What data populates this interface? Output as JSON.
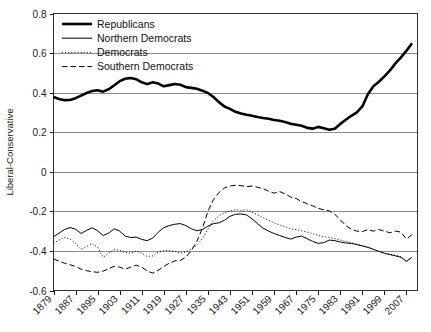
{
  "chart_data": {
    "type": "line",
    "title": "",
    "xlabel": "",
    "ylabel": "Liberal-Conservative",
    "xlim": [
      1879,
      2011
    ],
    "ylim": [
      -0.6,
      0.8
    ],
    "grid": true,
    "legend_position": "top-left",
    "y_ticks": [
      "0.8",
      "0.6",
      "0.4",
      "0.2",
      "0",
      "-0.2",
      "-0.4",
      "-0.6"
    ],
    "y_tick_values": [
      0.8,
      0.6,
      0.4,
      0.2,
      0,
      -0.2,
      -0.4,
      -0.6
    ],
    "x_ticks": [
      "1879",
      "1887",
      "1895",
      "1903",
      "1911",
      "1919",
      "1927",
      "1935",
      "1943",
      "1951",
      "1959",
      "1967",
      "1975",
      "1983",
      "1991",
      "1999",
      "2007"
    ],
    "x_tick_values": [
      1879,
      1887,
      1895,
      1903,
      1911,
      1919,
      1927,
      1935,
      1943,
      1951,
      1959,
      1967,
      1975,
      1983,
      1991,
      1999,
      2007
    ],
    "x": [
      1879,
      1881,
      1883,
      1885,
      1887,
      1889,
      1891,
      1893,
      1895,
      1897,
      1899,
      1901,
      1903,
      1905,
      1907,
      1909,
      1911,
      1913,
      1915,
      1917,
      1919,
      1921,
      1923,
      1925,
      1927,
      1929,
      1931,
      1933,
      1935,
      1937,
      1939,
      1941,
      1943,
      1945,
      1947,
      1949,
      1951,
      1953,
      1955,
      1957,
      1959,
      1961,
      1963,
      1965,
      1967,
      1969,
      1971,
      1973,
      1975,
      1977,
      1979,
      1981,
      1983,
      1985,
      1987,
      1989,
      1991,
      1993,
      1995,
      1997,
      1999,
      2001,
      2003,
      2005,
      2007,
      2009
    ],
    "series": [
      {
        "name": "Republicans",
        "style": "thick-solid",
        "values": [
          0.378,
          0.368,
          0.362,
          0.363,
          0.372,
          0.385,
          0.398,
          0.408,
          0.412,
          0.405,
          0.417,
          0.437,
          0.458,
          0.47,
          0.474,
          0.468,
          0.452,
          0.443,
          0.452,
          0.446,
          0.432,
          0.438,
          0.444,
          0.44,
          0.428,
          0.424,
          0.42,
          0.41,
          0.398,
          0.378,
          0.352,
          0.33,
          0.318,
          0.303,
          0.295,
          0.288,
          0.283,
          0.277,
          0.272,
          0.268,
          0.262,
          0.258,
          0.252,
          0.243,
          0.238,
          0.233,
          0.222,
          0.218,
          0.227,
          0.22,
          0.212,
          0.218,
          0.242,
          0.263,
          0.283,
          0.3,
          0.33,
          0.392,
          0.432,
          0.455,
          0.482,
          0.512,
          0.548,
          0.578,
          0.612,
          0.65
        ]
      },
      {
        "name": "Northern Democrats",
        "style": "thin-solid",
        "values": [
          -0.328,
          -0.31,
          -0.292,
          -0.282,
          -0.29,
          -0.312,
          -0.296,
          -0.283,
          -0.298,
          -0.322,
          -0.31,
          -0.288,
          -0.3,
          -0.325,
          -0.332,
          -0.33,
          -0.342,
          -0.348,
          -0.335,
          -0.305,
          -0.282,
          -0.272,
          -0.265,
          -0.262,
          -0.272,
          -0.288,
          -0.298,
          -0.292,
          -0.275,
          -0.262,
          -0.258,
          -0.245,
          -0.225,
          -0.215,
          -0.213,
          -0.218,
          -0.238,
          -0.262,
          -0.285,
          -0.3,
          -0.312,
          -0.322,
          -0.332,
          -0.34,
          -0.33,
          -0.325,
          -0.338,
          -0.352,
          -0.362,
          -0.358,
          -0.345,
          -0.348,
          -0.355,
          -0.36,
          -0.362,
          -0.368,
          -0.375,
          -0.382,
          -0.392,
          -0.402,
          -0.412,
          -0.418,
          -0.425,
          -0.432,
          -0.452,
          -0.432
        ]
      },
      {
        "name": "Democrats",
        "style": "dotted",
        "values": [
          -0.362,
          -0.345,
          -0.332,
          -0.34,
          -0.362,
          -0.392,
          -0.378,
          -0.362,
          -0.382,
          -0.432,
          -0.412,
          -0.392,
          -0.398,
          -0.408,
          -0.412,
          -0.4,
          -0.412,
          -0.428,
          -0.425,
          -0.405,
          -0.398,
          -0.398,
          -0.402,
          -0.412,
          -0.405,
          -0.39,
          -0.37,
          -0.338,
          -0.29,
          -0.248,
          -0.222,
          -0.208,
          -0.198,
          -0.192,
          -0.195,
          -0.192,
          -0.205,
          -0.218,
          -0.232,
          -0.245,
          -0.258,
          -0.268,
          -0.278,
          -0.288,
          -0.292,
          -0.298,
          -0.305,
          -0.312,
          -0.322,
          -0.328,
          -0.332,
          -0.338,
          -0.345,
          -0.352,
          -0.358,
          -0.365,
          -0.372,
          -0.38,
          -0.392,
          -0.402,
          -0.412,
          -0.418,
          -0.422,
          -0.43,
          -0.455,
          -0.432
        ]
      },
      {
        "name": "Southern Democrats",
        "style": "dashed",
        "values": [
          -0.44,
          -0.452,
          -0.462,
          -0.47,
          -0.478,
          -0.492,
          -0.5,
          -0.505,
          -0.508,
          -0.502,
          -0.49,
          -0.478,
          -0.482,
          -0.492,
          -0.482,
          -0.472,
          -0.482,
          -0.502,
          -0.512,
          -0.498,
          -0.478,
          -0.462,
          -0.45,
          -0.448,
          -0.432,
          -0.398,
          -0.352,
          -0.285,
          -0.2,
          -0.14,
          -0.105,
          -0.082,
          -0.072,
          -0.068,
          -0.07,
          -0.075,
          -0.072,
          -0.078,
          -0.085,
          -0.098,
          -0.108,
          -0.1,
          -0.112,
          -0.128,
          -0.135,
          -0.15,
          -0.162,
          -0.172,
          -0.185,
          -0.192,
          -0.198,
          -0.215,
          -0.242,
          -0.272,
          -0.29,
          -0.3,
          -0.302,
          -0.292,
          -0.3,
          -0.292,
          -0.3,
          -0.308,
          -0.3,
          -0.305,
          -0.34,
          -0.318
        ]
      }
    ],
    "legend_entries": [
      {
        "label": "Republicans",
        "style": "thick-solid"
      },
      {
        "label": "Northern Democrats",
        "style": "thin-solid"
      },
      {
        "label": "Democrats",
        "style": "dotted"
      },
      {
        "label": "Southern Democrats",
        "style": "dashed"
      }
    ],
    "colors": {
      "line": "#000000",
      "grid": "#8c8c8c",
      "axis": "#1a1a1a",
      "background": "#ffffff"
    }
  }
}
